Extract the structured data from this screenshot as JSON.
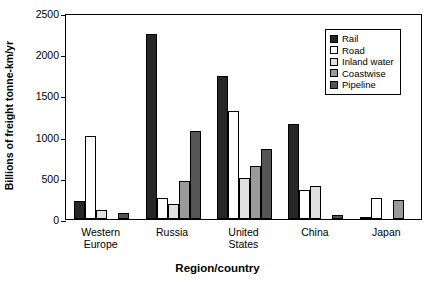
{
  "chart_data": {
    "type": "bar",
    "title": "",
    "xlabel": "Region/country",
    "ylabel": "Billions of freight tonne-km/yr",
    "ylim": [
      0,
      2500
    ],
    "yticks": [
      0,
      500,
      1000,
      1500,
      2000,
      2500
    ],
    "ytick_labels": [
      "0",
      "500",
      "1000",
      "1500",
      "2000",
      "2500"
    ],
    "grid": false,
    "legend_position": "upper right",
    "categories": [
      "Western\nEurope",
      "Russia",
      "United\nStates",
      "China",
      "Japan"
    ],
    "category_labels": [
      "Western Europe",
      "Russia",
      "United States",
      "China",
      "Japan"
    ],
    "series": [
      {
        "name": "Rail",
        "color": "#262626",
        "values": [
          220,
          2250,
          1735,
          1150,
          20
        ]
      },
      {
        "name": "Road",
        "color": "#ffffff",
        "values": [
          1010,
          250,
          1315,
          350,
          250
        ]
      },
      {
        "name": "Inland water",
        "color": "#e0e0e0",
        "values": [
          110,
          180,
          500,
          395,
          0
        ]
      },
      {
        "name": "Coastwise",
        "color": "#9a9a9a",
        "values": [
          0,
          465,
          640,
          0,
          225
        ]
      },
      {
        "name": "Pipeline",
        "color": "#555555",
        "values": [
          70,
          1070,
          845,
          45,
          0
        ]
      }
    ]
  },
  "legend": {
    "items": [
      {
        "label": "Rail",
        "color": "#262626"
      },
      {
        "label": "Road",
        "color": "#ffffff"
      },
      {
        "label": "Inland water",
        "color": "#e0e0e0"
      },
      {
        "label": "Coastwise",
        "color": "#9a9a9a"
      },
      {
        "label": "Pipeline",
        "color": "#555555"
      }
    ]
  }
}
